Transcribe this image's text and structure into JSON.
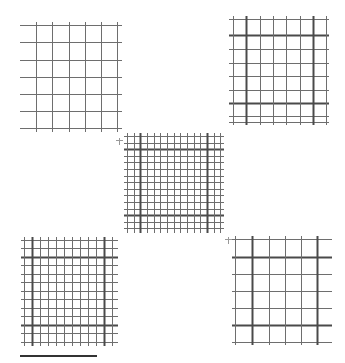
{
  "figure": {
    "background": "#ffffff",
    "line_color": "#6e6e6e",
    "bold_line_color": "#4a4a4a",
    "panels": [
      {
        "id": "top-left",
        "x": 20,
        "y": 25,
        "width": 102,
        "height": 104,
        "h_lines": [
          0,
          17,
          35,
          52,
          69,
          86,
          103
        ],
        "v_lines": [
          16,
          32,
          49,
          65,
          81,
          97
        ],
        "bold_h": [],
        "bold_v": []
      },
      {
        "id": "top-right",
        "x": 229,
        "y": 19,
        "width": 100,
        "height": 103,
        "h_lines": [
          0,
          16,
          30,
          44,
          57,
          71,
          84,
          97,
          103
        ],
        "v_lines": [
          4,
          17,
          31,
          44,
          57,
          71,
          84,
          97
        ],
        "bold_h": [
          16,
          84
        ],
        "bold_v": [
          17,
          84
        ]
      },
      {
        "id": "center",
        "x": 124,
        "y": 136,
        "width": 100,
        "height": 94,
        "h_lines": [
          0,
          7,
          13,
          20,
          26,
          33,
          40,
          46,
          53,
          59,
          66,
          73,
          79,
          86,
          92
        ],
        "v_lines": [
          3,
          10,
          16,
          23,
          30,
          36,
          43,
          50,
          56,
          63,
          70,
          76,
          83,
          90,
          96
        ],
        "bold_h": [
          13,
          79
        ],
        "bold_v": [
          16,
          83
        ]
      },
      {
        "id": "bottom-left",
        "x": 21,
        "y": 240,
        "width": 97,
        "height": 103,
        "h_lines": [
          0,
          8,
          17,
          25,
          34,
          42,
          51,
          59,
          68,
          76,
          85,
          93,
          102
        ],
        "v_lines": [
          3,
          11,
          19,
          27,
          35,
          43,
          51,
          59,
          67,
          75,
          83,
          91
        ],
        "bold_h": [
          17,
          85
        ],
        "bold_v": [
          11,
          83
        ]
      },
      {
        "id": "bottom-right",
        "x": 232,
        "y": 239,
        "width": 100,
        "height": 103,
        "h_lines": [
          0,
          18,
          35,
          52,
          69,
          86,
          103
        ],
        "v_lines": [
          3,
          20,
          37,
          53,
          69,
          85
        ],
        "bold_h": [
          18,
          86
        ],
        "bold_v": [
          20,
          85
        ]
      }
    ],
    "scale_bar": {
      "x": 20,
      "y": 355,
      "width": 77,
      "height": 2
    },
    "markers": [
      {
        "x": 119,
        "y": 133
      },
      {
        "x": 228,
        "y": 232
      }
    ]
  }
}
